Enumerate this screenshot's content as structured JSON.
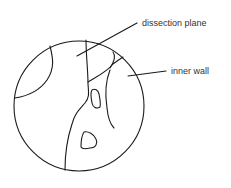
{
  "diagram": {
    "type": "anatomical-sketch",
    "labels": [
      {
        "id": "dissection-plane",
        "text": "dissection plane"
      },
      {
        "id": "inner-wall",
        "text": "inner wall"
      }
    ],
    "colors": {
      "stroke": "#1a1a1a",
      "text": "#333333",
      "background": "#ffffff"
    }
  }
}
